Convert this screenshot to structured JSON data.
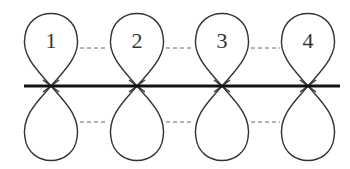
{
  "diagram": {
    "type": "p-orbital overlap (pi system)",
    "orbitals": [
      {
        "label": "1",
        "cx": 51
      },
      {
        "label": "2",
        "cx": 137
      },
      {
        "label": "3",
        "cx": 222
      },
      {
        "label": "4",
        "cx": 308
      }
    ],
    "axis": {
      "y": 86,
      "x1": 24,
      "x2": 340
    },
    "connectors": "dashed lines link adjacent lobes above and below the axis",
    "colors": {
      "line": "#111111",
      "lobe": "#333333",
      "dash": "#666666",
      "background": "#ffffff"
    }
  }
}
